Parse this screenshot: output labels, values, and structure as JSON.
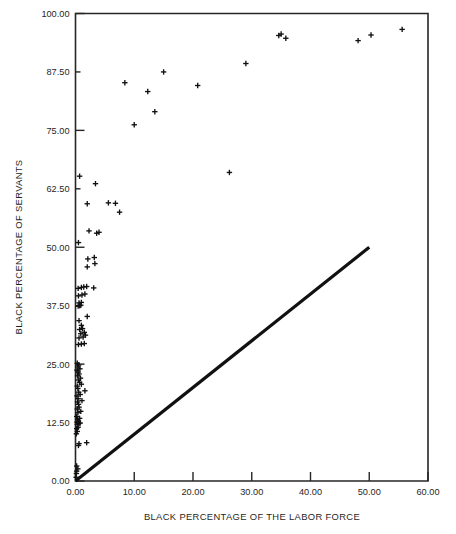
{
  "chart_data": {
    "type": "scatter",
    "title": "",
    "xlabel": "BLACK PERCENTAGE OF THE LABOR FORCE",
    "ylabel": "BLACK PERCENTAGE OF SERVANTS",
    "xlim": [
      0,
      60
    ],
    "ylim": [
      0,
      100
    ],
    "xticks": [
      0,
      10,
      20,
      30,
      40,
      50,
      60
    ],
    "yticks": [
      0,
      12.5,
      25,
      37.5,
      50,
      62.5,
      75,
      87.5,
      100
    ],
    "xtick_labels": [
      "0.00",
      "10.00",
      "20.00",
      "30.00",
      "40.00",
      "50.00",
      "60.00"
    ],
    "ytick_labels": [
      "0.00",
      "12.50",
      "25.00",
      "37.50",
      "50.00",
      "62.50",
      "75.00",
      "87.50",
      "100.00"
    ],
    "grid": false,
    "legend": false,
    "marker": "plus",
    "marker_color": "#111111",
    "reference_line": {
      "name": "parity-line",
      "description": "45-degree reference line from origin",
      "x": [
        0,
        50
      ],
      "y": [
        0,
        50
      ],
      "color": "#111111"
    },
    "series": [
      {
        "name": "cities",
        "points": [
          [
            0.1,
            0.8
          ],
          [
            0.15,
            1.6
          ],
          [
            0.2,
            2.1
          ],
          [
            0.4,
            2.6
          ],
          [
            0.2,
            3.2
          ],
          [
            0.5,
            7.6
          ],
          [
            0.6,
            8.0
          ],
          [
            1.9,
            8.2
          ],
          [
            0.15,
            10.1
          ],
          [
            0.3,
            10.6
          ],
          [
            0.2,
            11.2
          ],
          [
            0.45,
            11.5
          ],
          [
            0.3,
            12.1
          ],
          [
            0.6,
            12.3
          ],
          [
            0.8,
            12.4
          ],
          [
            0.25,
            12.6
          ],
          [
            0.5,
            12.8
          ],
          [
            0.35,
            13.2
          ],
          [
            0.7,
            13.4
          ],
          [
            0.2,
            13.8
          ],
          [
            0.4,
            14.6
          ],
          [
            0.9,
            14.9
          ],
          [
            0.3,
            15.4
          ],
          [
            0.6,
            15.8
          ],
          [
            0.5,
            16.4
          ],
          [
            0.35,
            16.9
          ],
          [
            1.1,
            17.2
          ],
          [
            0.45,
            17.6
          ],
          [
            0.25,
            18.2
          ],
          [
            0.8,
            18.5
          ],
          [
            0.55,
            19.0
          ],
          [
            1.6,
            19.3
          ],
          [
            0.4,
            19.8
          ],
          [
            0.3,
            20.3
          ],
          [
            1.0,
            20.7
          ],
          [
            0.7,
            21.1
          ],
          [
            0.5,
            21.6
          ],
          [
            0.85,
            22.0
          ],
          [
            0.35,
            22.5
          ],
          [
            0.6,
            22.9
          ],
          [
            0.45,
            23.3
          ],
          [
            0.25,
            23.7
          ],
          [
            0.75,
            24.0
          ],
          [
            0.4,
            24.4
          ],
          [
            0.55,
            24.8
          ],
          [
            0.3,
            25.2
          ],
          [
            0.5,
            29.2
          ],
          [
            1.0,
            29.3
          ],
          [
            1.5,
            29.4
          ],
          [
            0.6,
            30.6
          ],
          [
            1.3,
            30.8
          ],
          [
            1.7,
            31.2
          ],
          [
            0.9,
            31.5
          ],
          [
            1.5,
            31.8
          ],
          [
            0.7,
            32.4
          ],
          [
            1.2,
            32.6
          ],
          [
            1.0,
            33.3
          ],
          [
            0.6,
            34.3
          ],
          [
            2.0,
            35.2
          ],
          [
            0.45,
            37.4
          ],
          [
            0.7,
            37.5
          ],
          [
            0.9,
            37.6
          ],
          [
            0.6,
            38.1
          ],
          [
            1.0,
            38.2
          ],
          [
            0.5,
            39.6
          ],
          [
            1.1,
            39.8
          ],
          [
            1.6,
            40.0
          ],
          [
            0.45,
            41.2
          ],
          [
            1.0,
            41.4
          ],
          [
            1.4,
            41.5
          ],
          [
            1.9,
            41.6
          ],
          [
            3.1,
            41.3
          ],
          [
            2.0,
            45.8
          ],
          [
            3.3,
            46.5
          ],
          [
            2.1,
            47.5
          ],
          [
            3.2,
            47.8
          ],
          [
            0.5,
            51.0
          ],
          [
            2.3,
            53.5
          ],
          [
            3.6,
            53.0
          ],
          [
            4.0,
            53.2
          ],
          [
            2.0,
            59.3
          ],
          [
            5.6,
            59.5
          ],
          [
            6.8,
            59.4
          ],
          [
            7.5,
            57.5
          ],
          [
            0.7,
            65.2
          ],
          [
            3.4,
            63.6
          ],
          [
            26.2,
            66.0
          ],
          [
            8.4,
            85.2
          ],
          [
            10.0,
            76.2
          ],
          [
            12.3,
            83.3
          ],
          [
            13.5,
            79.0
          ],
          [
            15.0,
            87.5
          ],
          [
            20.8,
            84.6
          ],
          [
            29.0,
            89.3
          ],
          [
            34.6,
            95.3
          ],
          [
            35.0,
            95.6
          ],
          [
            35.8,
            94.7
          ],
          [
            48.1,
            94.2
          ],
          [
            50.3,
            95.4
          ],
          [
            55.6,
            96.6
          ]
        ]
      }
    ]
  },
  "axes": {
    "x_title": "BLACK PERCENTAGE OF THE LABOR FORCE",
    "y_title": "BLACK PERCENTAGE OF SERVANTS"
  }
}
